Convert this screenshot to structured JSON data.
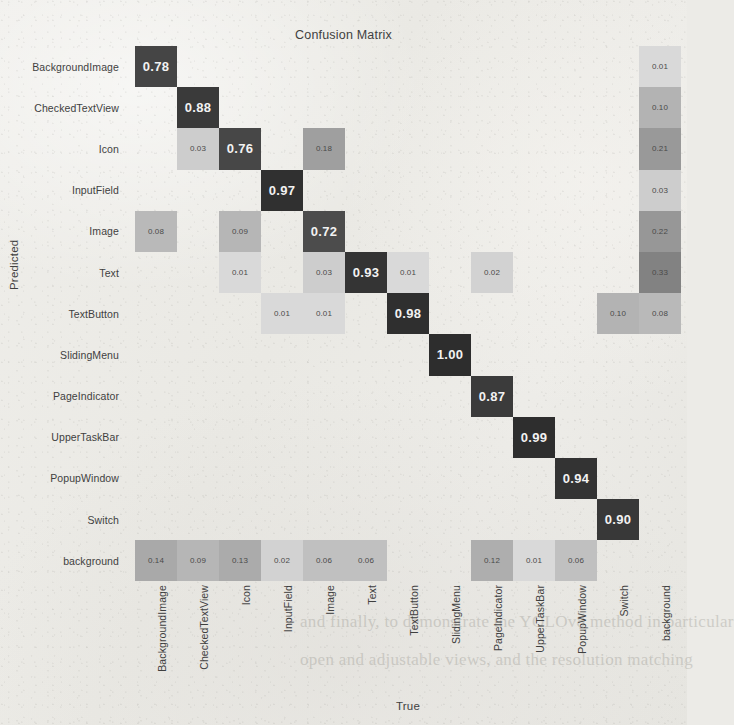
{
  "chart_data": {
    "type": "heatmap",
    "title": "Confusion Matrix",
    "xlabel": "True",
    "ylabel": "Predicted",
    "categories": [
      "BackgroundImage",
      "CheckedTextView",
      "Icon",
      "InputField",
      "Image",
      "Text",
      "TextButton",
      "SlidingMenu",
      "PageIndicator",
      "UpperTaskBar",
      "PopupWindow",
      "Switch",
      "background"
    ],
    "x_tick_labels": [
      "BackgroundImage",
      "CheckedTextView",
      "Icon",
      "InputField",
      "Image",
      "Text",
      "TextButton",
      "SlidingMenu",
      "PageIndicator",
      "UpperTaskBar",
      "PopupWindow",
      "Switch",
      "background"
    ],
    "y_tick_labels": [
      "BackgroundImage",
      "CheckedTextView",
      "Icon",
      "InputField",
      "Image",
      "Text",
      "TextButton",
      "SlidingMenu",
      "PageIndicator",
      "UpperTaskBar",
      "PopupWindow",
      "Switch",
      "background"
    ],
    "colormap": "Greys",
    "value_range": [
      0.0,
      1.0
    ],
    "grid": false,
    "legend": "none",
    "rows": [
      {
        "label": "BackgroundImage",
        "values": [
          0.78,
          null,
          null,
          null,
          null,
          null,
          null,
          null,
          null,
          null,
          null,
          null,
          0.01
        ]
      },
      {
        "label": "CheckedTextView",
        "values": [
          null,
          0.88,
          null,
          null,
          null,
          null,
          null,
          null,
          null,
          null,
          null,
          null,
          0.1
        ]
      },
      {
        "label": "Icon",
        "values": [
          null,
          0.03,
          0.76,
          null,
          0.18,
          null,
          null,
          null,
          null,
          null,
          null,
          null,
          0.21
        ]
      },
      {
        "label": "InputField",
        "values": [
          null,
          null,
          null,
          0.97,
          null,
          null,
          null,
          null,
          null,
          null,
          null,
          null,
          0.03
        ]
      },
      {
        "label": "Image",
        "values": [
          0.08,
          null,
          0.09,
          null,
          0.72,
          null,
          null,
          null,
          null,
          null,
          null,
          null,
          0.22
        ]
      },
      {
        "label": "Text",
        "values": [
          null,
          null,
          0.01,
          null,
          0.03,
          0.93,
          0.01,
          null,
          0.02,
          null,
          null,
          null,
          0.33
        ]
      },
      {
        "label": "TextButton",
        "values": [
          null,
          null,
          null,
          0.01,
          0.01,
          null,
          0.98,
          null,
          null,
          null,
          null,
          0.1,
          0.08
        ]
      },
      {
        "label": "SlidingMenu",
        "values": [
          null,
          null,
          null,
          null,
          null,
          null,
          null,
          1.0,
          null,
          null,
          null,
          null,
          null
        ]
      },
      {
        "label": "PageIndicator",
        "values": [
          null,
          null,
          null,
          null,
          null,
          null,
          null,
          null,
          0.87,
          null,
          null,
          null,
          null
        ]
      },
      {
        "label": "UpperTaskBar",
        "values": [
          null,
          null,
          null,
          null,
          null,
          null,
          null,
          null,
          null,
          0.99,
          null,
          null,
          null
        ]
      },
      {
        "label": "PopupWindow",
        "values": [
          null,
          null,
          null,
          null,
          null,
          null,
          null,
          null,
          null,
          null,
          0.94,
          null,
          null
        ]
      },
      {
        "label": "Switch",
        "values": [
          null,
          null,
          null,
          null,
          null,
          null,
          null,
          null,
          null,
          null,
          null,
          0.9,
          null
        ]
      },
      {
        "label": "background",
        "values": [
          0.14,
          0.09,
          0.13,
          0.02,
          0.06,
          0.06,
          null,
          null,
          0.12,
          0.01,
          0.06,
          null,
          null
        ]
      }
    ]
  },
  "page_bleed_text": {
    "line1": "and finally, to demonstrate the YOLOv8 method in particular",
    "line2": "open and adjustable views, and the resolution matching"
  }
}
